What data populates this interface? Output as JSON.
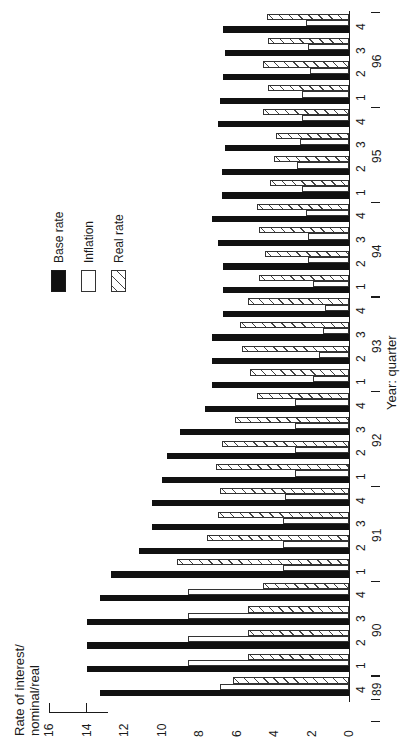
{
  "legend": {
    "items": [
      {
        "label": "Base rate",
        "style": "base"
      },
      {
        "label": "Inflation",
        "style": "infl"
      },
      {
        "label": "Real rate",
        "style": "real"
      }
    ]
  },
  "chart_data": {
    "type": "bar",
    "orientation": "rotated 90deg (value axis horizontal, categories vertical)",
    "title": "",
    "ylabel": "Rate of interest/ nominal/real",
    "xlabel": "Year: quarter",
    "ylim": [
      0,
      16
    ],
    "yticks": [
      0,
      2,
      4,
      6,
      8,
      10,
      12,
      14,
      16
    ],
    "grid": false,
    "legend_position": "upper left (rotated)",
    "years": [
      {
        "label": "89",
        "quarters": [
          "4"
        ]
      },
      {
        "label": "90",
        "quarters": [
          "1",
          "2",
          "3",
          "4"
        ]
      },
      {
        "label": "91",
        "quarters": [
          "1",
          "2",
          "3",
          "4"
        ]
      },
      {
        "label": "92",
        "quarters": [
          "1",
          "2",
          "3",
          "4"
        ]
      },
      {
        "label": "93",
        "quarters": [
          "1",
          "2",
          "3",
          "4"
        ]
      },
      {
        "label": "94",
        "quarters": [
          "1",
          "2",
          "3",
          "4"
        ]
      },
      {
        "label": "95",
        "quarters": [
          "1",
          "2",
          "3",
          "4"
        ]
      },
      {
        "label": "96",
        "quarters": [
          "1",
          "2",
          "3",
          "4"
        ]
      }
    ],
    "categories": [
      "89 Q4",
      "90 Q1",
      "90 Q2",
      "90 Q3",
      "90 Q4",
      "91 Q1",
      "91 Q2",
      "91 Q3",
      "91 Q4",
      "92 Q1",
      "92 Q2",
      "92 Q3",
      "92 Q4",
      "93 Q1",
      "93 Q2",
      "93 Q3",
      "93 Q4",
      "94 Q1",
      "94 Q2",
      "94 Q3",
      "94 Q4",
      "95 Q1",
      "95 Q2",
      "95 Q3",
      "95 Q4",
      "96 Q1",
      "96 Q2",
      "96 Q3",
      "96 Q4"
    ],
    "series": [
      {
        "name": "Base rate",
        "values": [
          13.3,
          14.0,
          14.0,
          14.0,
          13.3,
          12.7,
          11.2,
          10.5,
          10.5,
          10.0,
          9.7,
          9.0,
          7.7,
          7.3,
          7.3,
          7.3,
          6.7,
          6.7,
          6.7,
          7.0,
          7.3,
          6.8,
          6.8,
          6.6,
          7.0,
          6.9,
          6.7,
          6.6,
          6.7
        ]
      },
      {
        "name": "Inflation",
        "values": [
          6.9,
          8.6,
          8.6,
          8.6,
          8.6,
          3.5,
          3.5,
          3.5,
          3.4,
          2.9,
          2.9,
          2.9,
          2.9,
          1.9,
          1.6,
          1.4,
          1.3,
          1.9,
          2.2,
          2.2,
          2.3,
          2.5,
          2.8,
          2.6,
          2.5,
          2.5,
          2.1,
          2.2,
          2.3
        ]
      },
      {
        "name": "Real rate",
        "values": [
          6.2,
          5.4,
          5.4,
          5.4,
          4.6,
          9.2,
          7.6,
          7.0,
          6.9,
          7.1,
          6.8,
          6.1,
          4.9,
          5.3,
          5.7,
          5.8,
          5.4,
          4.8,
          4.5,
          4.8,
          4.9,
          4.2,
          4.0,
          3.9,
          4.6,
          4.3,
          4.6,
          4.3,
          4.4
        ]
      }
    ]
  }
}
